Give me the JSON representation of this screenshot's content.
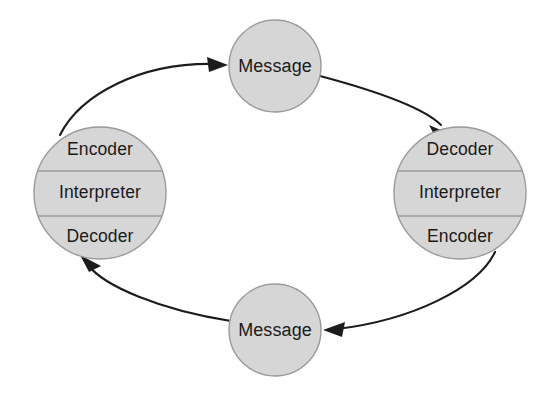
{
  "diagram": {
    "background_color": "#ffffff",
    "node_fill_color": "#d6d6d6",
    "node_stroke_color": "#9a9a9a",
    "arrow_color": "#1c1c1c",
    "text_color": "#1a1a1a",
    "flow_direction": "counterclockwise"
  },
  "nodes": {
    "top_message": {
      "label": "Message",
      "shape": "circle",
      "cx": 275,
      "cy": 66,
      "r": 46
    },
    "bottom_message": {
      "label": "Message",
      "shape": "circle",
      "cx": 275,
      "cy": 330,
      "r": 46
    },
    "left_participant": {
      "shape": "circle-banded",
      "cx": 100,
      "cy": 193,
      "r": 66,
      "bands": [
        {
          "label": "Encoder"
        },
        {
          "label": "Interpreter"
        },
        {
          "label": "Decoder"
        }
      ]
    },
    "right_participant": {
      "shape": "circle-banded",
      "cx": 460,
      "cy": 193,
      "r": 66,
      "bands": [
        {
          "label": "Decoder"
        },
        {
          "label": "Interpreter"
        },
        {
          "label": "Encoder"
        }
      ]
    }
  },
  "connectors": [
    {
      "name": "left-to-top-message",
      "from": "left_participant",
      "to": "top_message",
      "arrowhead": "end"
    },
    {
      "name": "top-message-to-right",
      "from": "top_message",
      "to": "right_participant",
      "arrowhead": "end"
    },
    {
      "name": "right-to-bottom-message",
      "from": "right_participant",
      "to": "bottom_message",
      "arrowhead": "end"
    },
    {
      "name": "bottom-message-to-left",
      "from": "bottom_message",
      "to": "left_participant",
      "arrowhead": "end"
    }
  ]
}
